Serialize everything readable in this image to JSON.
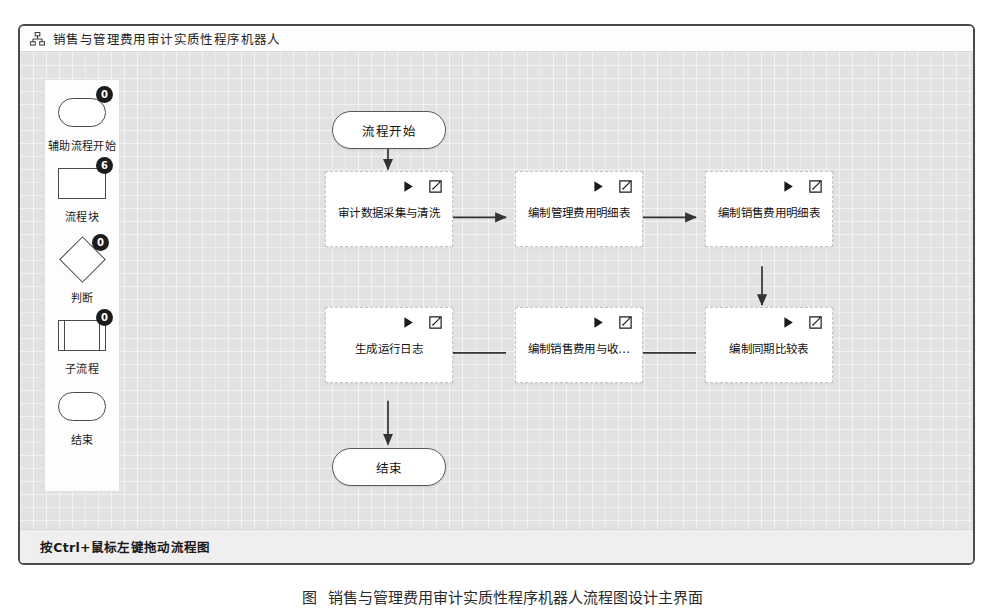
{
  "window": {
    "title": "销售与管理费用审计实质性程序机器人",
    "icon": "sitemap-icon"
  },
  "palette": {
    "items": [
      {
        "label": "辅助流程开始",
        "count": "0",
        "shape": "terminator"
      },
      {
        "label": "流程块",
        "count": "6",
        "shape": "rectangle"
      },
      {
        "label": "判断",
        "count": "0",
        "shape": "diamond"
      },
      {
        "label": "子流程",
        "count": "0",
        "shape": "subprocess"
      },
      {
        "label": "结束",
        "count": "",
        "shape": "terminator"
      }
    ]
  },
  "flow": {
    "node_icons": {
      "run": "play-icon",
      "edit": "edit-icon"
    },
    "nodes": [
      {
        "id": "start",
        "type": "terminator",
        "label": "流程开始"
      },
      {
        "id": "n1",
        "type": "process",
        "label": "审计数据采集与清洗"
      },
      {
        "id": "n2",
        "type": "process",
        "label": "编制管理费用明细表"
      },
      {
        "id": "n3",
        "type": "process",
        "label": "编制销售费用明细表"
      },
      {
        "id": "n4",
        "type": "process",
        "label": "编制同期比较表"
      },
      {
        "id": "n5",
        "type": "process",
        "label": "编制销售费用与收..."
      },
      {
        "id": "n6",
        "type": "process",
        "label": "生成运行日志"
      },
      {
        "id": "end",
        "type": "terminator",
        "label": "结束"
      }
    ]
  },
  "status": {
    "hint": "按Ctrl+鼠标左键拖动流程图"
  },
  "caption": {
    "label": "图",
    "number": "",
    "text": "销售与管理费用审计实质性程序机器人流程图设计主界面"
  },
  "colors": {
    "window_border": "#4a4a4a",
    "canvas": "#e2e2e2",
    "node_fill": "#ffffff",
    "node_border_dashed": "#c4c4c4",
    "terminator_border": "#55595e",
    "badge_bg": "#1c1c1c",
    "badge_text": "#ffffff",
    "connector": "#333333"
  }
}
